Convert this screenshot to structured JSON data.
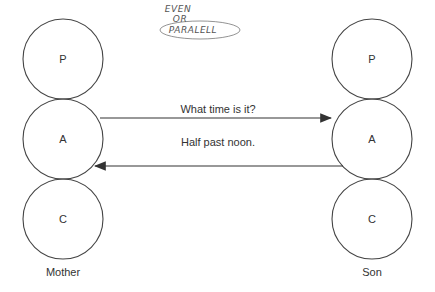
{
  "annotation": {
    "lines": [
      "EVEN",
      "OR",
      "PARALELL"
    ]
  },
  "mother": {
    "label": "Mother",
    "states": [
      "P",
      "A",
      "C"
    ]
  },
  "son": {
    "label": "Son",
    "states": [
      "P",
      "A",
      "C"
    ]
  },
  "transactions": [
    {
      "label": "What time is it?",
      "direction": "mother-to-son"
    },
    {
      "label": "Half past noon.",
      "direction": "son-to-mother"
    }
  ],
  "colors": {
    "stroke": "#333333",
    "text": "#333333"
  }
}
